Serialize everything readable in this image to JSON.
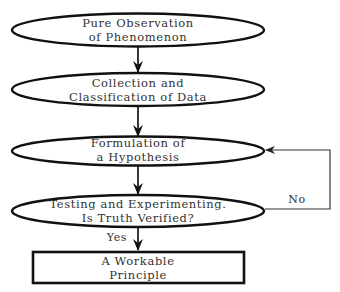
{
  "diagram": {
    "type": "flowchart",
    "colors": {
      "stroke": "#111111",
      "text": "#333333",
      "background": "#ffffff"
    },
    "nodes": [
      {
        "id": "observation",
        "shape": "ellipse",
        "lines": [
          "Pure Observation",
          "of Phenomenon"
        ]
      },
      {
        "id": "collection",
        "shape": "ellipse",
        "lines": [
          "Collection and",
          "Classification of Data"
        ]
      },
      {
        "id": "hypothesis",
        "shape": "ellipse",
        "lines": [
          "Formulation of",
          "a Hypothesis"
        ]
      },
      {
        "id": "testing",
        "shape": "ellipse",
        "lines": [
          "Testing and Experimenting.",
          "Is Truth Verified?"
        ]
      },
      {
        "id": "principle",
        "shape": "rectangle",
        "lines": [
          "A Workable",
          "Principle"
        ]
      }
    ],
    "edges": [
      {
        "from": "observation",
        "to": "collection",
        "label": ""
      },
      {
        "from": "collection",
        "to": "hypothesis",
        "label": ""
      },
      {
        "from": "hypothesis",
        "to": "testing",
        "label": ""
      },
      {
        "from": "testing",
        "to": "principle",
        "label": "Yes"
      },
      {
        "from": "testing",
        "to": "hypothesis",
        "label": "No"
      }
    ]
  }
}
